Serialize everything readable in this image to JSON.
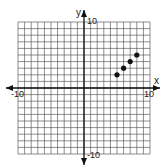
{
  "chart_data": {
    "type": "scatter",
    "title": "",
    "xlabel": "x",
    "ylabel": "y",
    "xlim": [
      -10,
      10
    ],
    "ylim": [
      -10,
      10
    ],
    "grid": true,
    "tick_labels": {
      "x_min": "-10",
      "x_max": "10",
      "y_min": "-10",
      "y_max": "10"
    },
    "series": [
      {
        "name": "points",
        "x": [
          5,
          6,
          7,
          8
        ],
        "y": [
          2,
          3,
          4,
          5
        ]
      }
    ]
  }
}
